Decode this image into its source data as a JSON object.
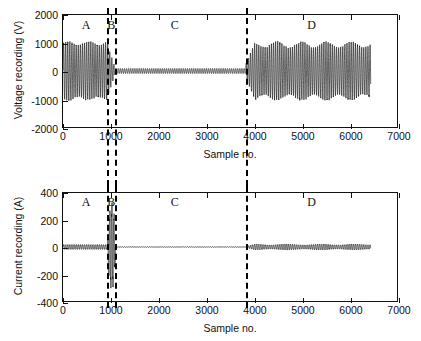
{
  "figure": {
    "background": "#ffffff",
    "line_color": "#111111",
    "divider_color": "#000000"
  },
  "panels": [
    {
      "id": "voltage",
      "ylabel": "Voltage recording (V)",
      "xlabel": "Sample no.",
      "yticks": [
        "-2000",
        "-1000",
        "0",
        "1000",
        "2000"
      ],
      "xticks": [
        "0",
        "1000",
        "2000",
        "3000",
        "4000",
        "5000",
        "6000",
        "7000"
      ]
    },
    {
      "id": "current",
      "ylabel": "Current recording (A)",
      "xlabel": "Sample no.",
      "yticks": [
        "-400",
        "-200",
        "0",
        "200",
        "400"
      ],
      "xticks": [
        "0",
        "1000",
        "2000",
        "3000",
        "4000",
        "5000",
        "6000",
        "7000"
      ]
    }
  ],
  "regions": [
    {
      "label": "A",
      "x_center": 500
    },
    {
      "label": "B",
      "x_center": 1025
    },
    {
      "label": "C",
      "x_center": 2350
    },
    {
      "label": "D",
      "x_center": 5200
    }
  ],
  "dividers": [
    940,
    1100,
    3830
  ],
  "chart_data": [
    {
      "type": "line",
      "title": "",
      "xlabel": "Sample no.",
      "ylabel": "Voltage recording (V)",
      "xlim": [
        0,
        7000
      ],
      "ylim": [
        -2000,
        2000
      ],
      "xticks": [
        0,
        1000,
        2000,
        3000,
        4000,
        5000,
        6000,
        7000
      ],
      "yticks": [
        -2000,
        -1000,
        0,
        1000,
        2000
      ],
      "grid": false,
      "legend": "none",
      "signal_end": 6450,
      "annotations": [
        {
          "text": "A",
          "x": 500,
          "y": 1700
        },
        {
          "text": "B",
          "x": 1025,
          "y": 1700
        },
        {
          "text": "C",
          "x": 2350,
          "y": 1700
        },
        {
          "text": "D",
          "x": 5200,
          "y": 1700
        }
      ],
      "vlines": [
        940,
        1100,
        3830
      ],
      "segments": [
        {
          "region": "A",
          "x_start": 0,
          "x_end": 940,
          "amplitude": 1050,
          "period": 44,
          "description": "steady sinusoidal voltage at nominal amplitude"
        },
        {
          "region": "B",
          "x_start": 940,
          "x_end": 1100,
          "amplitude": 900,
          "period": 44,
          "description": "transient, amplitude collapsing toward zero"
        },
        {
          "region": "C",
          "x_start": 1100,
          "x_end": 3830,
          "amplitude": 90,
          "period": 44,
          "description": "strongly suppressed voltage, near-zero oscillation"
        },
        {
          "region": "D",
          "x_start": 3830,
          "x_end": 6450,
          "amplitude": 1050,
          "period": 44,
          "description": "restored sinusoidal voltage with beat modulation"
        }
      ]
    },
    {
      "type": "line",
      "title": "",
      "xlabel": "Sample no.",
      "ylabel": "Current recording (A)",
      "xlim": [
        0,
        7000
      ],
      "ylim": [
        -400,
        400
      ],
      "xticks": [
        0,
        1000,
        2000,
        3000,
        4000,
        5000,
        6000,
        7000
      ],
      "yticks": [
        -400,
        -200,
        0,
        200,
        400
      ],
      "grid": false,
      "legend": "none",
      "signal_end": 6450,
      "annotations": [
        {
          "text": "A",
          "x": 500,
          "y": 320
        },
        {
          "text": "B",
          "x": 1025,
          "y": 320
        },
        {
          "text": "C",
          "x": 2350,
          "y": 320
        },
        {
          "text": "D",
          "x": 5200,
          "y": 320
        }
      ],
      "vlines": [
        940,
        1100,
        3830
      ],
      "segments": [
        {
          "region": "A",
          "x_start": 0,
          "x_end": 940,
          "amplitude": 18,
          "period": 44,
          "description": "small steady load current"
        },
        {
          "region": "B",
          "x_start": 940,
          "x_end": 1100,
          "amplitude": 320,
          "period": 44,
          "description": "large fault current spike reaching about plus or minus 320 A"
        },
        {
          "region": "C",
          "x_start": 1100,
          "x_end": 3830,
          "amplitude": 2,
          "period": 44,
          "description": "essentially zero current, interruption"
        },
        {
          "region": "D",
          "x_start": 3830,
          "x_end": 6450,
          "amplitude": 22,
          "period": 44,
          "description": "restored small load current"
        }
      ]
    }
  ]
}
